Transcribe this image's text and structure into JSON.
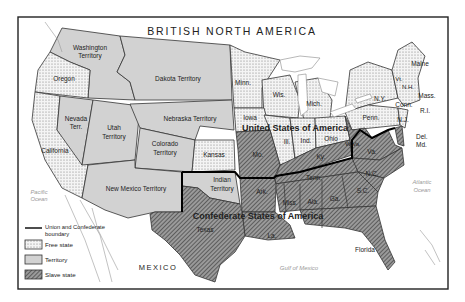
{
  "map": {
    "title_north": "BRITISH NORTH AMERICA",
    "union_label": "United States of America",
    "confederate_label": "Confederate States of America",
    "mexico_label": "MEXICO",
    "pacific_label_1": "Pacific",
    "pacific_label_2": "Ocean",
    "atlantic_label_1": "Atlantic",
    "atlantic_label_2": "Ocean",
    "gulf_label": "Gulf of Mexico",
    "regions": {
      "washington": [
        "Washington",
        "Territory"
      ],
      "oregon": "Oregon",
      "dakota": "Dakota Territory",
      "nevada": [
        "Nevada",
        "Terr."
      ],
      "utah": [
        "Utah",
        "Territory"
      ],
      "nebraska": "Nebraska Territory",
      "colorado": [
        "Colorado",
        "Territory"
      ],
      "california": "California",
      "kansas": "Kansas",
      "new_mexico": "New Mexico Territory",
      "indian": [
        "Indian",
        "Territory"
      ],
      "texas": "Texas",
      "minn": "Minn.",
      "wis": "Wis.",
      "mich": "Mich.",
      "iowa": "Iowa",
      "ill": "Ill.",
      "ind": "Ind.",
      "ohio": "Ohio",
      "mo": "Mo.",
      "ky": "Ky.",
      "wva": "W.Va.",
      "va": "Va.",
      "ny": "N.Y.",
      "penn": "Penn.",
      "nj": "N.J.",
      "del": "Del.",
      "md": "Md.",
      "maine": "Maine",
      "vt": "Vt.",
      "nh": "N.H.",
      "mass": "Mass.",
      "conn": "Conn.",
      "ri": "R.I.",
      "nc": "N.C.",
      "sc": "S.C.",
      "tenn": "Tenn.",
      "ark": "Ark.",
      "la": "La.",
      "miss": "Miss.",
      "ala": "Ala.",
      "ga": "Ga.",
      "florida": "Florida"
    }
  },
  "legend": {
    "boundary_1": "Union and Confederate",
    "boundary_2": "boundary",
    "free": "Free state",
    "territory": "Territory",
    "slave": "Slave state"
  },
  "colors": {
    "territory_fill": "#d2d2d2",
    "frame": "#222222"
  }
}
